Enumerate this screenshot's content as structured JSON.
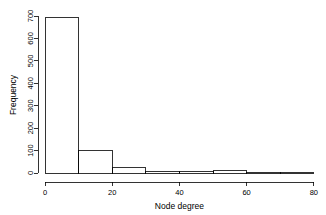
{
  "chart_data": {
    "type": "bar",
    "title": "",
    "subtitle": "",
    "xlabel": "Node degree",
    "ylabel": "Frequency",
    "xlim": [
      0,
      80
    ],
    "ylim": [
      0,
      700
    ],
    "grid": false,
    "legend": null,
    "bin_width": 10,
    "bin_edges": [
      0,
      10,
      20,
      30,
      40,
      50,
      60,
      70,
      80
    ],
    "categories": [
      "0-10",
      "10-20",
      "20-30",
      "30-40",
      "40-50",
      "50-60",
      "60-70",
      "70-80"
    ],
    "values": [
      695,
      100,
      25,
      8,
      5,
      11,
      2,
      2
    ],
    "xticks": [
      0,
      20,
      40,
      60,
      80
    ],
    "xtick_labels": [
      "0",
      "20",
      "40",
      "60",
      "80"
    ],
    "yticks": [
      0,
      100,
      200,
      300,
      400,
      500,
      600,
      700
    ],
    "ytick_labels": [
      "0",
      "100",
      "200",
      "300",
      "400",
      "500",
      "600",
      "700"
    ]
  },
  "axes": {
    "x_title": "Node degree",
    "y_title": "Frequency"
  },
  "xtick_labels": {
    "t0": "0",
    "t1": "20",
    "t2": "40",
    "t3": "60",
    "t4": "80"
  },
  "ytick_labels": {
    "t0": "0",
    "t1": "100",
    "t2": "200",
    "t3": "300",
    "t4": "400",
    "t5": "500",
    "t6": "600",
    "t7": "700"
  },
  "colors": {
    "background": "#ffffff",
    "foreground": "#000000",
    "bar_fill": "none",
    "bar_stroke": "#000000"
  }
}
